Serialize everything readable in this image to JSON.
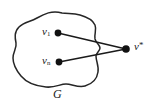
{
  "figure": {
    "caption_label": "G",
    "region": {
      "name": "G",
      "label": "G",
      "description": "closed irregular blob region"
    },
    "nodes": [
      {
        "id": "v1",
        "label_base": "v",
        "label_sub": "1",
        "label_sup": "",
        "x": 58,
        "y": 33,
        "radius": 3.4,
        "inside_region": true
      },
      {
        "id": "vn",
        "label_base": "v",
        "label_sub": "n",
        "label_sup": "",
        "x": 59,
        "y": 62,
        "radius": 3.4,
        "inside_region": true
      },
      {
        "id": "vstar",
        "label_base": "v",
        "label_sub": "",
        "label_sup": "*",
        "x": 126,
        "y": 49,
        "radius": 3.8,
        "inside_region": false
      }
    ],
    "edges": [
      {
        "id": "edge-v1-vstar",
        "from": "v1",
        "to": "vstar"
      },
      {
        "id": "edge-vn-vstar",
        "from": "vn",
        "to": "vstar"
      }
    ],
    "colors": {
      "ink": "#1a1a1a",
      "stroke": "#262626",
      "background": "#ffffff"
    },
    "blob_path": "M 62 13 C 52 10, 44 14, 37 18 C 30 22, 24 22, 19 27 C 14 32, 15 38, 16 43 C 17 48, 13 52, 13 58 C 13 64, 16 70, 21 76 C 26 82, 35 86, 46 87 C 55 88, 60 84, 66 84 C 72 84, 78 88, 85 86 C 92 84, 97 79, 98 72 C 99 66, 96 61, 96 56 C 96 53, 100 51, 100 48 C 100 45, 96 43, 95 39 C 94 34, 97 30, 95 25 C 93 20, 87 17, 80 15 C 73 13, 68 14, 62 13 Z"
  }
}
